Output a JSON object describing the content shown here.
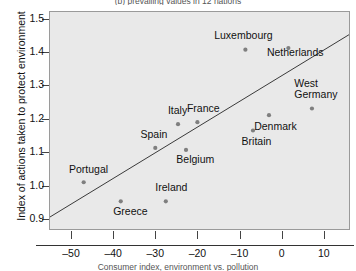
{
  "chart_data": {
    "type": "scatter",
    "title": "(b) prevailing values in 12 nations",
    "xlabel": "Consumer index, environment vs. pollution",
    "ylabel": "Index of actions taken to protect environment",
    "xlim": [
      -55,
      16
    ],
    "ylim": [
      0.87,
      1.52
    ],
    "xticks": [
      -50,
      -40,
      -30,
      -20,
      -10,
      0,
      10
    ],
    "xtick_labels": [
      "–50",
      "–40",
      "–30",
      "–20",
      "–10",
      "0",
      "10"
    ],
    "yticks": [
      0.9,
      1.0,
      1.1,
      1.2,
      1.3,
      1.4,
      1.5
    ],
    "ytick_labels": [
      "0.9",
      "1.0",
      "1.1",
      "1.2",
      "1.3",
      "1.4",
      "1.5"
    ],
    "grid": false,
    "legend": "none",
    "point_color": "#7f7f7f",
    "trendline_color": "#3a3a3a",
    "plot_background": "#e9e9e9",
    "trendline": {
      "x0": -55,
      "y0": 0.906,
      "x1": 16,
      "y1": 1.452
    },
    "points": [
      {
        "label": "Portugal",
        "x": -47.0,
        "y": 1.01,
        "lx": -50.5,
        "ly": 1.047,
        "align": "left",
        "lines": 1
      },
      {
        "label": "Greece",
        "x": -38.2,
        "y": 0.953,
        "lx": -40.0,
        "ly": 0.922,
        "align": "left",
        "lines": 1
      },
      {
        "label": "Spain",
        "x": -30.0,
        "y": 1.113,
        "lx": -33.5,
        "ly": 1.152,
        "align": "left",
        "lines": 1
      },
      {
        "label": "Ireland",
        "x": -27.5,
        "y": 0.953,
        "lx": -30.0,
        "ly": 0.992,
        "align": "left",
        "lines": 1
      },
      {
        "label": "Italy",
        "x": -24.6,
        "y": 1.184,
        "lx": -27.0,
        "ly": 1.223,
        "align": "left",
        "lines": 1
      },
      {
        "label": "Belgium",
        "x": -22.7,
        "y": 1.107,
        "lx": -25.0,
        "ly": 1.077,
        "align": "left",
        "lines": 1
      },
      {
        "label": "France",
        "x": -20.0,
        "y": 1.19,
        "lx": -22.5,
        "ly": 1.231,
        "align": "left",
        "lines": 1
      },
      {
        "label": "Luxembourg",
        "x": -8.6,
        "y": 1.407,
        "lx": -16.0,
        "ly": 1.447,
        "align": "left",
        "lines": 1
      },
      {
        "label": "Britain",
        "x": -6.8,
        "y": 1.165,
        "lx": -9.5,
        "ly": 1.131,
        "align": "left",
        "lines": 1
      },
      {
        "label": "Denmark",
        "x": -3.0,
        "y": 1.211,
        "lx": -6.5,
        "ly": 1.175,
        "align": "left",
        "lines": 1
      },
      {
        "label": "Netherlands",
        "x": 1.6,
        "y": 1.412,
        "lx": -3.5,
        "ly": 1.398,
        "align": "left",
        "lines": 1
      },
      {
        "label": "West\nGermany",
        "x": 7.2,
        "y": 1.231,
        "lx": 3.0,
        "ly": 1.305,
        "align": "left",
        "lines": 2
      }
    ]
  }
}
